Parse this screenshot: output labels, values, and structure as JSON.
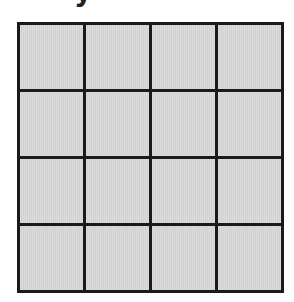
{
  "title": {
    "visible_fragment": "y"
  },
  "grid": {
    "rows": 4,
    "columns": 4,
    "cell_fill": "#d8d8d8",
    "line_color": "#1a1a1a",
    "cells": [
      [
        "",
        "",
        "",
        ""
      ],
      [
        "",
        "",
        "",
        ""
      ],
      [
        "",
        "",
        "",
        ""
      ],
      [
        "",
        "",
        "",
        ""
      ]
    ]
  }
}
